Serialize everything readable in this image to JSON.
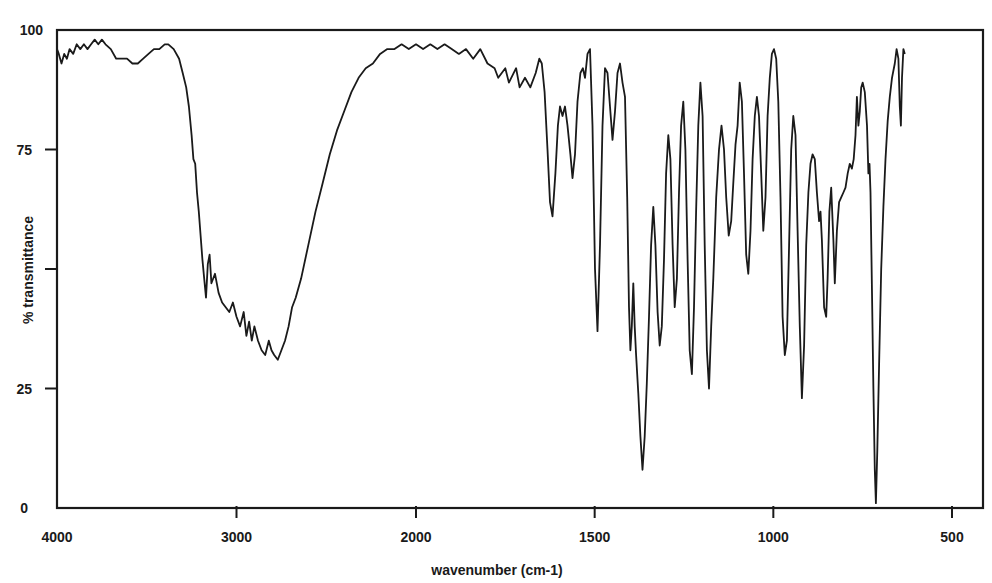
{
  "chart_data": {
    "type": "line",
    "title": "",
    "xlabel": "wavenumber (cm-1)",
    "ylabel": "% transmittance",
    "x_ticks": [
      4000,
      3000,
      2000,
      1500,
      1000,
      500
    ],
    "x_tick_labels": [
      "4000",
      "3000",
      "2000",
      "1500",
      "1000",
      "500"
    ],
    "y_ticks": [
      0,
      25,
      50,
      75,
      100
    ],
    "y_tick_labels": [
      "0",
      "25",
      "",
      "75",
      "100"
    ],
    "xlim": [
      4000,
      450
    ],
    "ylim": [
      0,
      100
    ],
    "x_scale_note": "split scale: 4000-2000 compressed, 2000-450 expanded",
    "grid": false,
    "legend": null,
    "line_color": "#1a1a1a",
    "series": [
      {
        "name": "IR spectrum",
        "points": [
          [
            4000,
            96
          ],
          [
            3990,
            95
          ],
          [
            3975,
            93
          ],
          [
            3960,
            95
          ],
          [
            3945,
            94
          ],
          [
            3930,
            96
          ],
          [
            3910,
            95
          ],
          [
            3890,
            97
          ],
          [
            3870,
            96
          ],
          [
            3850,
            97
          ],
          [
            3830,
            96
          ],
          [
            3810,
            97
          ],
          [
            3790,
            98
          ],
          [
            3770,
            97
          ],
          [
            3750,
            98
          ],
          [
            3730,
            97
          ],
          [
            3700,
            96
          ],
          [
            3670,
            94
          ],
          [
            3640,
            94
          ],
          [
            3610,
            94
          ],
          [
            3580,
            93
          ],
          [
            3550,
            93
          ],
          [
            3520,
            94
          ],
          [
            3490,
            95
          ],
          [
            3460,
            96
          ],
          [
            3430,
            96
          ],
          [
            3400,
            97
          ],
          [
            3380,
            97
          ],
          [
            3350,
            96
          ],
          [
            3320,
            94
          ],
          [
            3300,
            91
          ],
          [
            3280,
            88
          ],
          [
            3265,
            84
          ],
          [
            3250,
            78
          ],
          [
            3240,
            73
          ],
          [
            3230,
            72
          ],
          [
            3220,
            66
          ],
          [
            3210,
            62
          ],
          [
            3200,
            57
          ],
          [
            3190,
            52
          ],
          [
            3180,
            48
          ],
          [
            3170,
            44
          ],
          [
            3160,
            51
          ],
          [
            3150,
            53
          ],
          [
            3140,
            47
          ],
          [
            3120,
            49
          ],
          [
            3100,
            45
          ],
          [
            3080,
            43
          ],
          [
            3060,
            42
          ],
          [
            3040,
            41
          ],
          [
            3020,
            43
          ],
          [
            3000,
            40
          ],
          [
            2980,
            38
          ],
          [
            2960,
            41
          ],
          [
            2945,
            36
          ],
          [
            2930,
            39
          ],
          [
            2915,
            35
          ],
          [
            2900,
            38
          ],
          [
            2880,
            35
          ],
          [
            2860,
            33
          ],
          [
            2840,
            32
          ],
          [
            2820,
            35
          ],
          [
            2805,
            33
          ],
          [
            2790,
            32
          ],
          [
            2770,
            31
          ],
          [
            2750,
            33
          ],
          [
            2730,
            35
          ],
          [
            2710,
            38
          ],
          [
            2690,
            42
          ],
          [
            2670,
            44
          ],
          [
            2640,
            48
          ],
          [
            2600,
            55
          ],
          [
            2560,
            62
          ],
          [
            2520,
            68
          ],
          [
            2480,
            74
          ],
          [
            2440,
            79
          ],
          [
            2400,
            83
          ],
          [
            2360,
            87
          ],
          [
            2320,
            90
          ],
          [
            2280,
            92
          ],
          [
            2240,
            93
          ],
          [
            2200,
            95
          ],
          [
            2160,
            96
          ],
          [
            2120,
            96
          ],
          [
            2080,
            97
          ],
          [
            2040,
            96
          ],
          [
            2000,
            97
          ],
          [
            1980,
            96
          ],
          [
            1960,
            97
          ],
          [
            1940,
            96
          ],
          [
            1920,
            97
          ],
          [
            1900,
            96
          ],
          [
            1880,
            95
          ],
          [
            1860,
            96
          ],
          [
            1840,
            94
          ],
          [
            1820,
            96
          ],
          [
            1800,
            93
          ],
          [
            1780,
            92
          ],
          [
            1770,
            90
          ],
          [
            1750,
            92
          ],
          [
            1740,
            89
          ],
          [
            1720,
            92
          ],
          [
            1710,
            88
          ],
          [
            1695,
            90
          ],
          [
            1680,
            88
          ],
          [
            1665,
            91
          ],
          [
            1655,
            94
          ],
          [
            1648,
            93
          ],
          [
            1640,
            87
          ],
          [
            1632,
            75
          ],
          [
            1625,
            64
          ],
          [
            1618,
            61
          ],
          [
            1610,
            70
          ],
          [
            1603,
            80
          ],
          [
            1597,
            84
          ],
          [
            1590,
            82
          ],
          [
            1583,
            84
          ],
          [
            1576,
            80
          ],
          [
            1568,
            74
          ],
          [
            1562,
            69
          ],
          [
            1555,
            74
          ],
          [
            1548,
            85
          ],
          [
            1540,
            91
          ],
          [
            1533,
            92
          ],
          [
            1527,
            90
          ],
          [
            1520,
            95
          ],
          [
            1513,
            96
          ],
          [
            1506,
            80
          ],
          [
            1499,
            50
          ],
          [
            1492,
            37
          ],
          [
            1485,
            55
          ],
          [
            1478,
            80
          ],
          [
            1471,
            92
          ],
          [
            1464,
            91
          ],
          [
            1457,
            84
          ],
          [
            1450,
            77
          ],
          [
            1443,
            83
          ],
          [
            1436,
            91
          ],
          [
            1429,
            93
          ],
          [
            1422,
            89
          ],
          [
            1415,
            86
          ],
          [
            1409,
            65
          ],
          [
            1404,
            42
          ],
          [
            1400,
            33
          ],
          [
            1396,
            38
          ],
          [
            1392,
            47
          ],
          [
            1388,
            38
          ],
          [
            1384,
            32
          ],
          [
            1378,
            24
          ],
          [
            1372,
            15
          ],
          [
            1366,
            8
          ],
          [
            1360,
            15
          ],
          [
            1354,
            26
          ],
          [
            1348,
            40
          ],
          [
            1342,
            55
          ],
          [
            1336,
            63
          ],
          [
            1330,
            55
          ],
          [
            1324,
            41
          ],
          [
            1318,
            34
          ],
          [
            1312,
            38
          ],
          [
            1306,
            52
          ],
          [
            1300,
            70
          ],
          [
            1294,
            78
          ],
          [
            1288,
            73
          ],
          [
            1282,
            55
          ],
          [
            1276,
            42
          ],
          [
            1270,
            48
          ],
          [
            1264,
            66
          ],
          [
            1258,
            80
          ],
          [
            1252,
            85
          ],
          [
            1246,
            75
          ],
          [
            1240,
            52
          ],
          [
            1234,
            33
          ],
          [
            1228,
            28
          ],
          [
            1222,
            42
          ],
          [
            1216,
            62
          ],
          [
            1210,
            80
          ],
          [
            1204,
            89
          ],
          [
            1198,
            82
          ],
          [
            1192,
            55
          ],
          [
            1186,
            33
          ],
          [
            1180,
            25
          ],
          [
            1174,
            38
          ],
          [
            1168,
            48
          ],
          [
            1160,
            65
          ],
          [
            1152,
            75
          ],
          [
            1145,
            80
          ],
          [
            1138,
            75
          ],
          [
            1132,
            65
          ],
          [
            1125,
            57
          ],
          [
            1118,
            60
          ],
          [
            1112,
            68
          ],
          [
            1106,
            76
          ],
          [
            1100,
            80
          ],
          [
            1094,
            89
          ],
          [
            1088,
            85
          ],
          [
            1082,
            70
          ],
          [
            1076,
            53
          ],
          [
            1070,
            49
          ],
          [
            1064,
            58
          ],
          [
            1058,
            73
          ],
          [
            1052,
            82
          ],
          [
            1046,
            86
          ],
          [
            1040,
            82
          ],
          [
            1034,
            70
          ],
          [
            1028,
            58
          ],
          [
            1022,
            65
          ],
          [
            1016,
            82
          ],
          [
            1010,
            90
          ],
          [
            1004,
            95
          ],
          [
            998,
            96
          ],
          [
            992,
            94
          ],
          [
            986,
            85
          ],
          [
            980,
            65
          ],
          [
            974,
            40
          ],
          [
            968,
            32
          ],
          [
            962,
            35
          ],
          [
            956,
            55
          ],
          [
            950,
            75
          ],
          [
            944,
            82
          ],
          [
            938,
            78
          ],
          [
            932,
            58
          ],
          [
            926,
            38
          ],
          [
            920,
            23
          ],
          [
            914,
            34
          ],
          [
            908,
            55
          ],
          [
            902,
            66
          ],
          [
            896,
            72
          ],
          [
            890,
            74
          ],
          [
            884,
            73
          ],
          [
            878,
            66
          ],
          [
            872,
            60
          ],
          [
            868,
            62
          ],
          [
            864,
            56
          ],
          [
            858,
            42
          ],
          [
            852,
            40
          ],
          [
            848,
            48
          ],
          [
            843,
            62
          ],
          [
            838,
            67
          ],
          [
            832,
            56
          ],
          [
            828,
            47
          ],
          [
            822,
            58
          ],
          [
            816,
            64
          ],
          [
            810,
            65
          ],
          [
            804,
            66
          ],
          [
            798,
            67
          ],
          [
            792,
            70
          ],
          [
            786,
            72
          ],
          [
            780,
            71
          ],
          [
            775,
            73
          ],
          [
            770,
            78
          ],
          [
            766,
            86
          ],
          [
            762,
            80
          ],
          [
            758,
            83
          ],
          [
            754,
            88
          ],
          [
            750,
            89
          ],
          [
            744,
            87
          ],
          [
            738,
            80
          ],
          [
            734,
            70
          ],
          [
            731,
            72
          ],
          [
            728,
            66
          ],
          [
            724,
            45
          ],
          [
            720,
            25
          ],
          [
            716,
            8
          ],
          [
            713,
            1
          ],
          [
            709,
            12
          ],
          [
            704,
            30
          ],
          [
            698,
            50
          ],
          [
            692,
            63
          ],
          [
            686,
            73
          ],
          [
            680,
            81
          ],
          [
            674,
            86
          ],
          [
            668,
            90
          ],
          [
            660,
            93
          ],
          [
            655,
            96
          ],
          [
            650,
            94
          ],
          [
            646,
            84
          ],
          [
            643,
            80
          ],
          [
            640,
            90
          ],
          [
            636,
            96
          ],
          [
            632,
            95
          ]
        ]
      }
    ]
  }
}
